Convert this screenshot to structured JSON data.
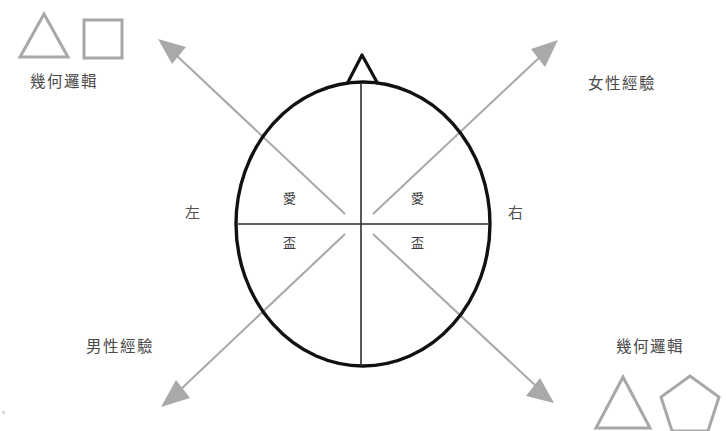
{
  "diagram": {
    "title_absent": true,
    "background_color": "#ffffff",
    "outline_color": "#111111",
    "arrow_color": "#a6a6a6",
    "shape_color": "#a8a8a8",
    "inner_line_color": "#333333",
    "corner_labels": {
      "top_left": "幾何邏輯",
      "top_right": "女性經驗",
      "bottom_left": "男性經驗",
      "bottom_right": "幾何邏輯"
    },
    "side_labels": {
      "left": "左",
      "right": "右"
    },
    "quadrant_labels": {
      "upper_left": "愛",
      "upper_right": "愛",
      "lower_left": "盃",
      "lower_right": "盃"
    },
    "corner_shapes": {
      "top_left": [
        "triangle-outline",
        "square-outline"
      ],
      "bottom_right": [
        "triangle-outline",
        "pentagon-outline"
      ]
    },
    "arrows": [
      {
        "name": "arrow-up-left",
        "from": [
          345,
          215
        ],
        "to": [
          160,
          41
        ]
      },
      {
        "name": "arrow-up-right",
        "from": [
          372,
          215
        ],
        "to": [
          556,
          42
        ]
      },
      {
        "name": "arrow-down-left",
        "from": [
          345,
          233
        ],
        "to": [
          164,
          404
        ]
      },
      {
        "name": "arrow-down-right",
        "from": [
          372,
          233
        ],
        "to": [
          551,
          400
        ]
      }
    ],
    "artifact_mark": "。"
  }
}
